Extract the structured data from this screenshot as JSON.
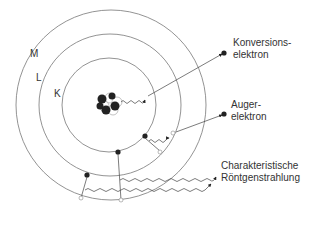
{
  "diagram": {
    "shells": [
      {
        "label": "K",
        "radius": 47
      },
      {
        "label": "L",
        "radius": 71
      },
      {
        "label": "M",
        "radius": 95
      }
    ],
    "labels": {
      "conversion_line1": "Konversions-",
      "conversion_line2": "elektron",
      "auger_line1": "Auger-",
      "auger_line2": "elektron",
      "xray_line1": "Charakteristische",
      "xray_line2": "Röntgenstrahlung"
    },
    "colors": {
      "line": "#555555",
      "electron": "#222222",
      "text": "#333333"
    }
  }
}
